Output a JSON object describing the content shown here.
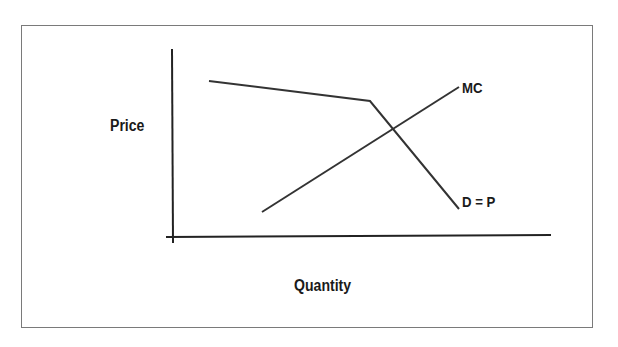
{
  "diagram": {
    "title": "",
    "axes": {
      "y_label": "Price",
      "x_label": "Quantity"
    },
    "curves": [
      {
        "id": "demand",
        "label": "D = P",
        "description": "Kinked demand curve: shallow slope then steep slope",
        "points": [
          [
            209,
            81
          ],
          [
            370,
            101
          ],
          [
            459,
            209
          ]
        ]
      },
      {
        "id": "marginal-cost",
        "label": "MC",
        "description": "Upward-sloping marginal cost curve",
        "points": [
          [
            262,
            212
          ],
          [
            459,
            87
          ]
        ]
      }
    ],
    "colors": {
      "line": "#333333",
      "axis": "#222222",
      "frame": "#7a7a7a",
      "text": "#1a1a1a",
      "background": "#ffffff"
    }
  }
}
